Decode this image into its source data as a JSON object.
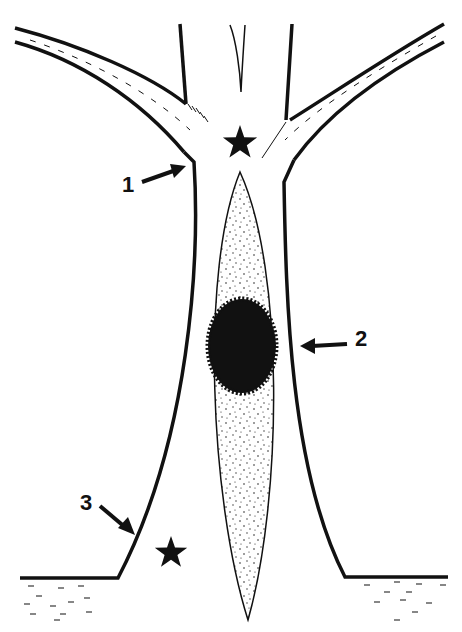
{
  "diagram": {
    "type": "schematic illustration",
    "colors": {
      "ink": "#111111",
      "background": "#ffffff",
      "stipple": "#222222"
    },
    "labels": [
      {
        "id": "1",
        "text": "1",
        "x": 122,
        "y": 174,
        "arrow_to": [
          186,
          166
        ]
      },
      {
        "id": "2",
        "text": "2",
        "x": 355,
        "y": 328,
        "arrow_to": [
          300,
          346
        ]
      },
      {
        "id": "3",
        "text": "3",
        "x": 80,
        "y": 492,
        "arrow_to": [
          135,
          535
        ]
      }
    ],
    "stars": [
      {
        "id": "star-top",
        "cx": 240,
        "cy": 143,
        "r": 18
      },
      {
        "id": "star-bottom",
        "cx": 171,
        "cy": 553,
        "r": 17
      }
    ],
    "structures": [
      {
        "id": "trunk",
        "description": "vertical stem flaring into base"
      },
      {
        "id": "left-branch",
        "description": "branch extending upper-left"
      },
      {
        "id": "right-branch",
        "description": "branch extending upper-right"
      },
      {
        "id": "spindle",
        "description": "stippled lens-shaped body in stem"
      },
      {
        "id": "dark-core",
        "description": "spiky dark oval mass within spindle"
      },
      {
        "id": "ground",
        "description": "ground line with dashed soil marks"
      }
    ]
  }
}
